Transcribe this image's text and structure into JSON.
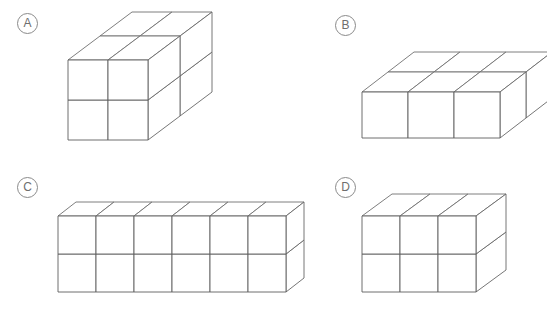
{
  "page": {
    "background_color": "#ffffff",
    "line_color": "#5d5d5d",
    "label_color": "#6e6e6e",
    "width": 547,
    "height": 311
  },
  "options": [
    {
      "id": "A",
      "label": "A",
      "label_x": 17,
      "label_y": 13,
      "origin_x": 68,
      "origin_y": 140,
      "cell": 40,
      "depth_dx": 32,
      "depth_dy": -24,
      "dims": {
        "width": 2,
        "height": 2,
        "depth": 2
      },
      "cube_count": 8,
      "description": "2 by 2 by 2 cube"
    },
    {
      "id": "B",
      "label": "B",
      "label_x": 335,
      "label_y": 15,
      "origin_x": 362,
      "origin_y": 138,
      "cell": 46,
      "depth_dx": 26,
      "depth_dy": -20,
      "dims": {
        "width": 3,
        "height": 1,
        "depth": 2
      },
      "cube_count": 6,
      "description": "3 wide by 1 tall by 2 deep slab"
    },
    {
      "id": "C",
      "label": "C",
      "label_x": 17,
      "label_y": 177,
      "origin_x": 58,
      "origin_y": 292,
      "cell": 38,
      "depth_dx": 18,
      "depth_dy": -14,
      "dims": {
        "width": 6,
        "height": 2,
        "depth": 1
      },
      "cube_count": 12,
      "description": "6 wide by 2 tall by 1 deep bar"
    },
    {
      "id": "D",
      "label": "D",
      "label_x": 335,
      "label_y": 177,
      "origin_x": 362,
      "origin_y": 292,
      "cell": 38,
      "depth_dx": 30,
      "depth_dy": -22,
      "dims": {
        "width": 3,
        "height": 2,
        "depth": 1
      },
      "cube_count": 6,
      "description": "3 wide by 2 tall by 1 deep block"
    }
  ]
}
